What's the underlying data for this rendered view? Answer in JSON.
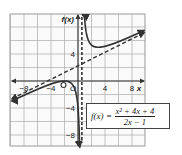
{
  "chart_data": {
    "type": "line",
    "title": "",
    "function_label": "f(x)",
    "formula": {
      "lhs": "f(x)",
      "equals": "=",
      "numerator": "x² + 4x + 4",
      "denominator": "2x − 1"
    },
    "xlabel": "x",
    "ylabel": "f(x)",
    "xlim": [
      -10,
      10
    ],
    "ylim": [
      -10,
      10
    ],
    "grid": true,
    "grid_step": 2,
    "x_ticks": [
      -8,
      -4,
      4,
      8
    ],
    "y_ticks": [
      4,
      -4,
      -8
    ],
    "x_tick_labels": [
      "−8",
      "−4",
      "4",
      "8"
    ],
    "y_tick_labels": [
      "4",
      "−4",
      "−8"
    ],
    "origin_label": "O",
    "vertical_asymptote": {
      "x": 0.5,
      "style": "dashed"
    },
    "oblique_asymptote": {
      "equation": "y = 0.5x + 2.25",
      "style": "dashed"
    },
    "hole_or_zero": {
      "x": -2,
      "y": 0,
      "marker": "open-circle"
    },
    "series": [
      {
        "name": "f(x) left branch",
        "x": [
          -10,
          -8,
          -6,
          -4,
          -2,
          -1,
          0,
          0.3,
          0.45
        ],
        "y": [
          -3.05,
          -1.8,
          -0.62,
          0.0,
          0.0,
          -0.33,
          -4,
          -14.5,
          -50
        ]
      },
      {
        "name": "f(x) right branch",
        "x": [
          0.55,
          0.7,
          1,
          2,
          4,
          6,
          8,
          10
        ],
        "y": [
          50,
          17.5,
          9,
          5.33,
          5.14,
          5.82,
          6.67,
          7.58
        ]
      }
    ]
  }
}
